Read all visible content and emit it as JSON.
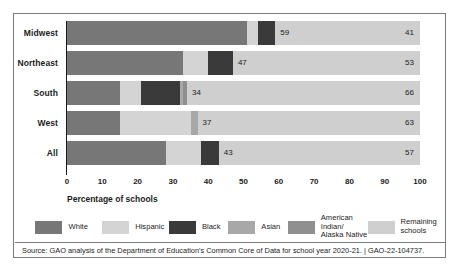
{
  "chart_data": {
    "type": "bar",
    "orientation": "horizontal",
    "stacked": true,
    "title": "",
    "xlabel": "Percentage of schools",
    "ylabel": "",
    "xlim": [
      0,
      100
    ],
    "xticks": [
      0,
      10,
      20,
      30,
      40,
      50,
      60,
      70,
      80,
      90,
      100
    ],
    "xtick_labels": [
      "0",
      "10",
      "20",
      "30",
      "40",
      "50",
      "60",
      "70",
      "80",
      "90",
      "100"
    ],
    "grid": false,
    "legend_position": "bottom",
    "categories": [
      "Midwest",
      "Northeast",
      "South",
      "West",
      "All"
    ],
    "series": [
      {
        "name": "White",
        "color": "#777777",
        "values": [
          51,
          33,
          15,
          15,
          28
        ]
      },
      {
        "name": "Hispanic",
        "color": "#d4d4d4",
        "values": [
          3,
          7,
          6,
          20,
          10
        ]
      },
      {
        "name": "Black",
        "color": "#3a3a3a",
        "values": [
          5,
          7,
          11,
          0,
          5
        ]
      },
      {
        "name": "Asian",
        "color": "#a8a8a8",
        "values": [
          0,
          0,
          1,
          2,
          0
        ]
      },
      {
        "name": "American Indian/\nAlaska Native",
        "color": "#8f8f8f",
        "values": [
          0,
          0,
          1,
          0,
          0
        ]
      },
      {
        "name": "Remaining\nschools",
        "color": "#cfcfcf",
        "values": [
          41,
          53,
          66,
          63,
          57
        ]
      }
    ],
    "segment_labels": {
      "majority_total": [
        59,
        47,
        34,
        37,
        43
      ],
      "remaining": [
        41,
        53,
        66,
        63,
        57
      ]
    },
    "annotations": []
  },
  "rows": [
    {
      "label": "Midwest",
      "segments": [
        {
          "name": "White",
          "start": 0,
          "end": 51,
          "color": "#777777"
        },
        {
          "name": "Hispanic",
          "start": 51,
          "end": 54,
          "color": "#d4d4d4"
        },
        {
          "name": "Black",
          "start": 54,
          "end": 59,
          "color": "#3a3a3a"
        },
        {
          "name": "Remaining schools",
          "start": 59,
          "end": 100,
          "color": "#cfcfcf"
        }
      ],
      "value_label": "59",
      "remaining_label": "41"
    },
    {
      "label": "Northeast",
      "segments": [
        {
          "name": "White",
          "start": 0,
          "end": 33,
          "color": "#777777"
        },
        {
          "name": "Hispanic",
          "start": 33,
          "end": 40,
          "color": "#d4d4d4"
        },
        {
          "name": "Black",
          "start": 40,
          "end": 47,
          "color": "#3a3a3a"
        },
        {
          "name": "Remaining schools",
          "start": 47,
          "end": 100,
          "color": "#cfcfcf"
        }
      ],
      "value_label": "47",
      "remaining_label": "53"
    },
    {
      "label": "South",
      "segments": [
        {
          "name": "White",
          "start": 0,
          "end": 15,
          "color": "#777777"
        },
        {
          "name": "Hispanic",
          "start": 15,
          "end": 21,
          "color": "#d4d4d4"
        },
        {
          "name": "Black",
          "start": 21,
          "end": 32,
          "color": "#3a3a3a"
        },
        {
          "name": "Asian",
          "start": 32,
          "end": 33,
          "color": "#a8a8a8"
        },
        {
          "name": "American Indian/Alaska Native",
          "start": 33,
          "end": 34,
          "color": "#8f8f8f"
        },
        {
          "name": "Remaining schools",
          "start": 34,
          "end": 100,
          "color": "#cfcfcf"
        }
      ],
      "value_label": "34",
      "remaining_label": "66"
    },
    {
      "label": "West",
      "segments": [
        {
          "name": "White",
          "start": 0,
          "end": 15,
          "color": "#777777"
        },
        {
          "name": "Hispanic",
          "start": 15,
          "end": 35,
          "color": "#d4d4d4"
        },
        {
          "name": "Asian",
          "start": 35,
          "end": 37,
          "color": "#a8a8a8"
        },
        {
          "name": "Remaining schools",
          "start": 37,
          "end": 100,
          "color": "#cfcfcf"
        }
      ],
      "value_label": "37",
      "remaining_label": "63"
    },
    {
      "label": "All",
      "segments": [
        {
          "name": "White",
          "start": 0,
          "end": 28,
          "color": "#777777"
        },
        {
          "name": "Hispanic",
          "start": 28,
          "end": 38,
          "color": "#d4d4d4"
        },
        {
          "name": "Black",
          "start": 38,
          "end": 43,
          "color": "#3a3a3a"
        },
        {
          "name": "Remaining schools",
          "start": 43,
          "end": 100,
          "color": "#cfcfcf"
        }
      ],
      "value_label": "43",
      "remaining_label": "57"
    }
  ],
  "axis": {
    "x_title": "Percentage of schools",
    "ticks": [
      "0",
      "10",
      "20",
      "30",
      "40",
      "50",
      "60",
      "70",
      "80",
      "90",
      "100"
    ]
  },
  "legend": {
    "items": [
      {
        "label": "White",
        "color": "#777777",
        "left": 20,
        "width": 92
      },
      {
        "label": "Hispanic",
        "color": "#d4d4d4",
        "left": 112,
        "width": 92
      },
      {
        "label": "Black",
        "color": "#3a3a3a",
        "left": 204,
        "width": 82
      },
      {
        "label": "Asian",
        "color": "#a8a8a8",
        "left": 286,
        "width": 82
      },
      {
        "label": "American Indian/\nAlaska Native",
        "color": "#8f8f8f",
        "left": 368,
        "width": 110
      },
      {
        "label": "Remaining\nschools",
        "color": "#cfcfcf",
        "left": 478,
        "width": 100
      }
    ]
  },
  "source": {
    "text": "Source: GAO analysis of the Department of Education's Common Core of Data for school year 2020-21.  |  GAO-22-104737."
  }
}
